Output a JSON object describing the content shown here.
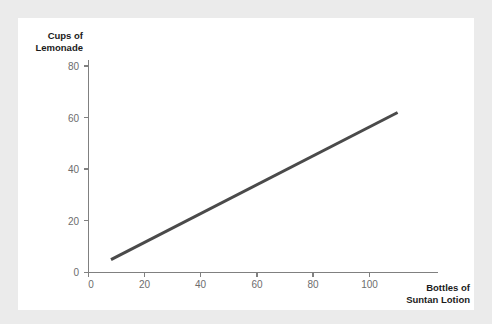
{
  "canvas": {
    "width": 492,
    "height": 324,
    "background_color": "#ebebeb",
    "card_color": "#ffffff"
  },
  "chart_data": {
    "type": "line",
    "title": "",
    "subtitle": "",
    "xlabel": "Bottles of Suntan Lotion",
    "xlabel_lines": [
      "Bottles of",
      "Suntan Lotion"
    ],
    "ylabel": "Cups of Lemonade",
    "ylabel_lines": [
      "Cups of",
      "Lemonade"
    ],
    "xlim": [
      0,
      114
    ],
    "ylim": [
      0,
      86
    ],
    "xticks": [
      0,
      20,
      40,
      60,
      80,
      100
    ],
    "yticks": [
      0,
      20,
      40,
      60,
      80
    ],
    "xtick_labels": [
      "0",
      "20",
      "40",
      "60",
      "80",
      "100"
    ],
    "ytick_labels": [
      "0",
      "20",
      "40",
      "60",
      "80"
    ],
    "grid": false,
    "legend": null,
    "legend_position": "none",
    "annotations": [],
    "series": [
      {
        "name": "Lemonade vs Suntan Lotion",
        "color": "#4a4a4a",
        "line_width": 3,
        "x": [
          8,
          110
        ],
        "y": [
          5,
          62
        ],
        "points": [
          {
            "x": 8,
            "y": 5
          },
          {
            "x": 110,
            "y": 62
          }
        ],
        "relationship": "positive linear",
        "slope": 0.559,
        "intercept": 0.53
      }
    ]
  },
  "axes": {
    "axis_color": "#808080",
    "tick_label_color": "#6d6d6d",
    "axis_title_color": "#1b1b1b"
  }
}
